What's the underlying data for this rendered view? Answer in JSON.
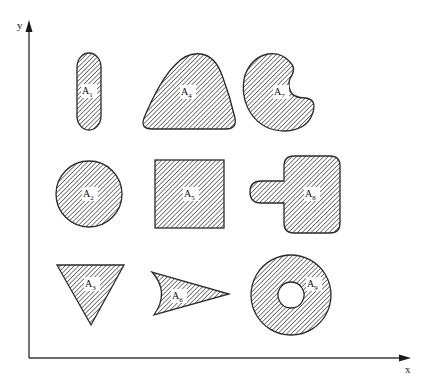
{
  "figure": {
    "axes": {
      "x_label": "x",
      "y_label": "y"
    },
    "regions": [
      {
        "name": "A",
        "sub": "1",
        "shape": "elongated-oval"
      },
      {
        "name": "A",
        "sub": "2",
        "shape": "circle"
      },
      {
        "name": "A",
        "sub": "3",
        "shape": "inverted-triangle"
      },
      {
        "name": "A",
        "sub": "4",
        "shape": "rounded-triangle"
      },
      {
        "name": "A",
        "sub": "5",
        "shape": "square"
      },
      {
        "name": "A",
        "sub": "6",
        "shape": "concave-arrowhead"
      },
      {
        "name": "A",
        "sub": "7",
        "shape": "kidney"
      },
      {
        "name": "A",
        "sub": "8",
        "shape": "rounded-square-with-tab"
      },
      {
        "name": "A",
        "sub": "9",
        "shape": "annulus"
      }
    ],
    "colors": {
      "fill_hatch": "#444444",
      "outline": "#2a2a2a",
      "background": "#ffffff"
    }
  }
}
